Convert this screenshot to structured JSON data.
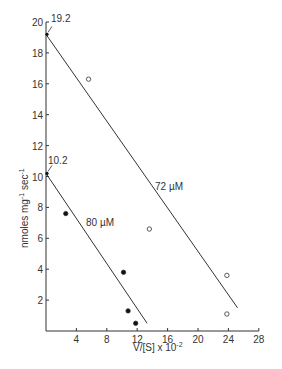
{
  "chart_data": {
    "type": "scatter",
    "title": "",
    "xlabel": "V/[S] x 10^-2",
    "ylabel": "nmoles mg^-1 sec^-1",
    "xlim": [
      0,
      28
    ],
    "ylim": [
      0,
      20
    ],
    "x_ticks": [
      4,
      8,
      12,
      16,
      20,
      24,
      28
    ],
    "y_ticks": [
      2,
      4,
      6,
      8,
      10,
      12,
      14,
      16,
      18,
      20
    ],
    "grid": false,
    "legend": "none (inline line labels)",
    "series": [
      {
        "name": "72 µM",
        "marker": "open-circle",
        "points": [
          [
            5.6,
            16.3
          ],
          [
            13.6,
            6.6
          ],
          [
            23.8,
            3.6
          ],
          [
            23.8,
            1.1
          ]
        ],
        "fit_line": [
          [
            0,
            19.2
          ],
          [
            25.2,
            1.5
          ]
        ],
        "intercept_label": "19.2",
        "intercept": [
          0,
          19.2
        ]
      },
      {
        "name": "80 µM",
        "marker": "filled-circle",
        "points": [
          [
            2.6,
            7.6
          ],
          [
            10.2,
            3.8
          ],
          [
            10.8,
            1.3
          ],
          [
            11.8,
            0.5
          ]
        ],
        "fit_line": [
          [
            0,
            10.2
          ],
          [
            13.3,
            0.5
          ]
        ],
        "intercept_label": "10.2",
        "intercept": [
          0,
          10.2
        ]
      }
    ],
    "annotations": [
      "19.2",
      "10.2",
      "72 µM",
      "80 µM"
    ]
  },
  "labels": {
    "xlabel_main": "V/[S] x 10",
    "xlabel_exp": "-2",
    "ylabel_main": "nmoles mg",
    "ylabel_exp1": "-1",
    "ylabel_sec": " sec",
    "ylabel_exp2": "-1",
    "series_72": "72 µM",
    "series_80": "80 µM",
    "int_72": "19.2",
    "int_80": "10.2"
  }
}
